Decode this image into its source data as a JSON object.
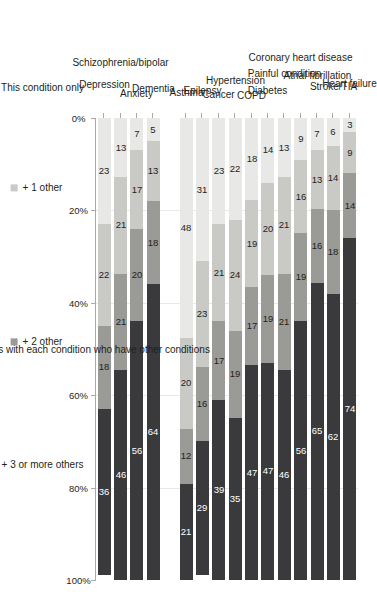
{
  "chart_data": {
    "type": "bar",
    "orientation": "horizontal-stacked-100",
    "title": "",
    "xlabel": "Percentage of patients with each condition who have other conditions",
    "ylabel": "",
    "xlim": [
      0,
      100
    ],
    "xticks": [
      "0%",
      "20%",
      "40%",
      "60%",
      "80%",
      "100%"
    ],
    "xtick_values": [
      0,
      20,
      40,
      60,
      80,
      100
    ],
    "grid": true,
    "legend_position": "bottom",
    "categories": [
      "Heart failure",
      "Stroke/TIA",
      "Atrial fibrillation",
      "Coronary heart disease",
      "Painful condition",
      "Diabetes",
      "COPD",
      "Hypertension",
      "Cancer",
      "Epilepsy",
      "Asthma",
      "Dementia",
      "Anxiety",
      "Schizophrenia/bipolar",
      "Depression"
    ],
    "group_break_after_index": 10,
    "series": [
      {
        "name": "This condition only",
        "color": "#e8e8e6",
        "values": [
          3,
          6,
          7,
          9,
          13,
          14,
          18,
          22,
          23,
          31,
          48,
          5,
          7,
          13,
          23
        ]
      },
      {
        "name": "+ 1 other",
        "color": "#c9c9c6",
        "values": [
          9,
          14,
          13,
          16,
          21,
          20,
          19,
          24,
          21,
          23,
          20,
          13,
          17,
          21,
          22
        ]
      },
      {
        "name": "+ 2 other",
        "color": "#9a9a96",
        "values": [
          14,
          18,
          16,
          19,
          21,
          19,
          17,
          19,
          17,
          16,
          12,
          18,
          20,
          21,
          18
        ]
      },
      {
        "name": "+ 3 or more others",
        "color": "#3a3a3c",
        "values": [
          74,
          62,
          65,
          56,
          46,
          47,
          47,
          35,
          39,
          29,
          21,
          64,
          56,
          46,
          36
        ]
      }
    ],
    "legend": [
      {
        "label": "This condition only",
        "color": "#e8e8e6"
      },
      {
        "label": "+ 1 other",
        "color": "#c9c9c6"
      },
      {
        "label": "+ 2 other",
        "color": "#9a9a96"
      },
      {
        "label": "+ 3 or more others",
        "color": "#3a3a3c"
      }
    ]
  }
}
